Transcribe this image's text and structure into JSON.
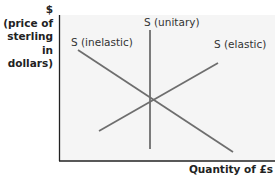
{
  "diagram": {
    "type": "supply elasticity diagram",
    "y_axis": {
      "symbol": "$",
      "label_lines": [
        "(price of",
        "sterling in",
        "dollars)"
      ]
    },
    "x_axis": {
      "label": "Quantity of £s"
    },
    "curves": [
      {
        "id": "inelastic",
        "label": "S (inelastic)",
        "description": "downward-sloping line"
      },
      {
        "id": "unitary",
        "label": "S (unitary)",
        "description": "vertical line"
      },
      {
        "id": "elastic",
        "label": "S (elastic)",
        "description": "upward-sloping line"
      }
    ],
    "colors": {
      "axis": "#222222",
      "line": "#6e6e6e",
      "panel": "#f5f5f5"
    }
  }
}
